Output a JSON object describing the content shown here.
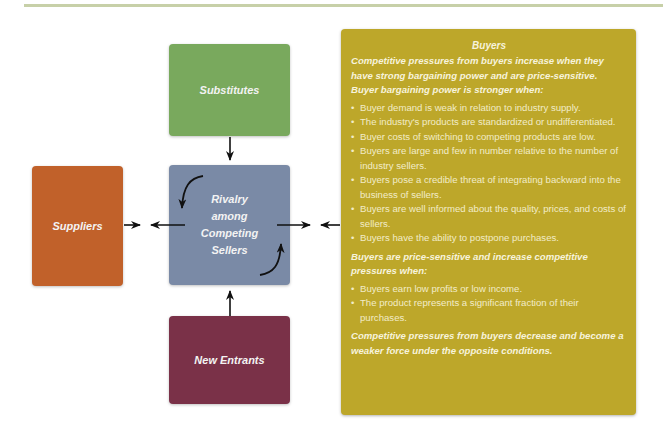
{
  "diagram": {
    "forces": {
      "substitutes": {
        "label": "Substitutes",
        "color": "#79a95d"
      },
      "rivalry": {
        "label_lines": [
          "Rivalry",
          "among",
          "Competing",
          "Sellers"
        ],
        "color": "#7a8aa6"
      },
      "suppliers": {
        "label": "Suppliers",
        "color": "#c1612a"
      },
      "new_entrants": {
        "label": "New Entrants",
        "color": "#7a3148"
      }
    },
    "buyers_panel": {
      "color": "#bda72a",
      "title": "Buyers",
      "bargaining_lead": "Competitive pressures from buyers increase when they have strong bargaining power and are price-sensitive. Buyer bargaining power is stronger when:",
      "bargaining_items": [
        "Buyer demand is weak in relation to industry supply.",
        "The industry's products are standardized or undifferentiated.",
        "Buyer costs of switching to competing products are low.",
        "Buyers are large and few in number relative to the number of industry sellers.",
        "Buyers pose a credible threat of integrating backward into the business of sellers.",
        "Buyers are well informed about the quality, prices, and costs of sellers.",
        "Buyers have the ability to postpone purchases."
      ],
      "price_lead": "Buyers are price-sensitive and increase competitive pressures when:",
      "price_items": [
        "Buyers earn low profits or low income.",
        "The product represents a significant fraction of their purchases."
      ],
      "closing": "Competitive pressures from buyers decrease and become a weaker force under the opposite conditions."
    }
  }
}
